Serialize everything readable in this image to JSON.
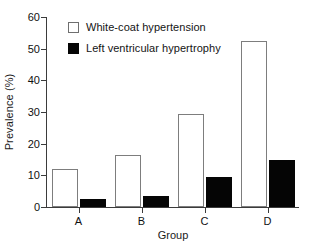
{
  "chart_data": {
    "type": "bar",
    "title": "",
    "subtitle": "",
    "xlabel": "Group",
    "ylabel": "Prevalence (%)",
    "categories": [
      "A",
      "B",
      "C",
      "D"
    ],
    "series": [
      {
        "name": "White-coat hypertension",
        "style": "open",
        "color": "#ffffff",
        "edge_color": "#7d7d7d",
        "values": [
          12,
          16.5,
          29.5,
          52.5
        ]
      },
      {
        "name": "Left ventricular hypertrophy",
        "style": "filled",
        "color": "#050505",
        "edge_color": "#050505",
        "values": [
          2.5,
          3.5,
          9.5,
          15
        ]
      }
    ],
    "ylim": [
      0,
      60
    ],
    "yticks": [
      0,
      10,
      20,
      30,
      40,
      50,
      60
    ],
    "ytick_labels": [
      "0",
      "10",
      "20",
      "30",
      "40",
      "50",
      "60"
    ],
    "grid": false,
    "legend_position": "top-left-inside"
  },
  "legend": {
    "entries": [
      {
        "label": "White-coat hypertension",
        "swatch": "open-square-icon"
      },
      {
        "label": "Left ventricular hypertrophy",
        "swatch": "filled-square-icon"
      }
    ]
  },
  "axes": {
    "y_label": "Prevalence (%)",
    "x_label": "Group"
  }
}
